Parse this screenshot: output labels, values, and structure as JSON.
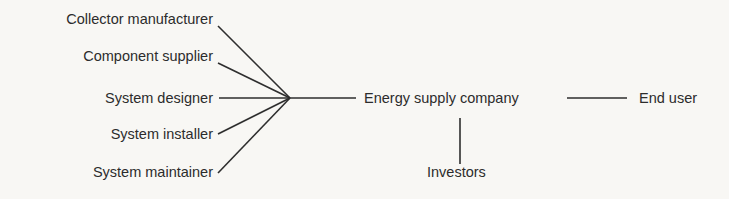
{
  "diagram": {
    "contributors": [
      {
        "label": "Collector manufacturer"
      },
      {
        "label": "Component supplier"
      },
      {
        "label": "System designer"
      },
      {
        "label": "System installer"
      },
      {
        "label": "System maintainer"
      }
    ],
    "hub": {
      "label": "Energy supply company"
    },
    "downstream": {
      "label": "End user"
    },
    "financing": {
      "label": "Investors"
    },
    "line_color": "#2e2e2e",
    "background": "#f8f7f4"
  }
}
